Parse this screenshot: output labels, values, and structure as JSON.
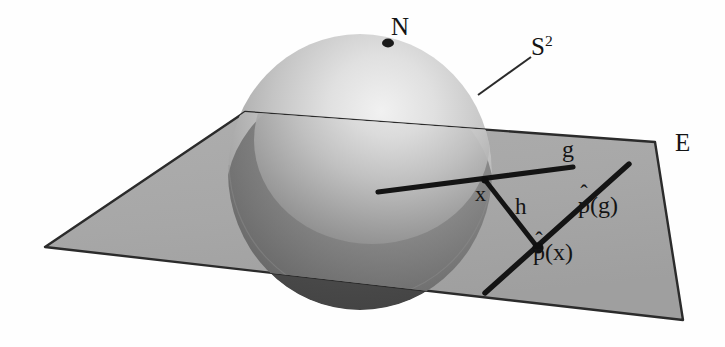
{
  "figure": {
    "type": "geometric-diagram",
    "background_color": "#fefefe",
    "plane_fill_color": "#a8a8a8",
    "plane_stroke_color": "#2b2b2b",
    "sphere_light_color": "#e6e6e6",
    "sphere_mid_color": "#9b9b9b",
    "sphere_dark_color": "#4a4a4a",
    "line_color": "#181818",
    "text_color": "#141414"
  },
  "labels": {
    "north_pole": "N",
    "sphere": "S",
    "sphere_exponent": "2",
    "plane": "E",
    "geodesic": "g",
    "point_x": "x",
    "height": "h",
    "projected_geodesic_hat": "p",
    "projected_geodesic_arg": "(g)",
    "projected_point_hat": "p",
    "projected_point_arg": "(x)",
    "hat_glyph": "̂"
  },
  "annotations": {
    "north_pole_marker": "filled-dot",
    "projection_point_marker": "filled-dot",
    "sphere_leader_line": "line from S-squared label to sphere surface"
  },
  "geometry": {
    "sphere": {
      "center_x": 360,
      "center_y": 172,
      "radius_x": 132,
      "radius_y": 138
    },
    "plane_corners": [
      [
        245,
        112
      ],
      [
        655,
        142
      ],
      [
        683,
        320
      ],
      [
        45,
        247
      ]
    ],
    "segment_g": {
      "from": [
        378,
        192
      ],
      "to": [
        573,
        167
      ]
    },
    "segment_h": {
      "from": [
        485,
        180
      ],
      "to": [
        538,
        248
      ]
    },
    "segment_p_of_g": {
      "from": [
        485,
        293
      ],
      "to": [
        629,
        164
      ]
    },
    "point_x": [
      485,
      180
    ],
    "point_p_of_x": [
      538,
      248
    ],
    "point_north_pole": [
      388,
      43
    ],
    "leader_line_s2": {
      "from": [
        478,
        95
      ],
      "to": [
        531,
        57
      ]
    }
  }
}
